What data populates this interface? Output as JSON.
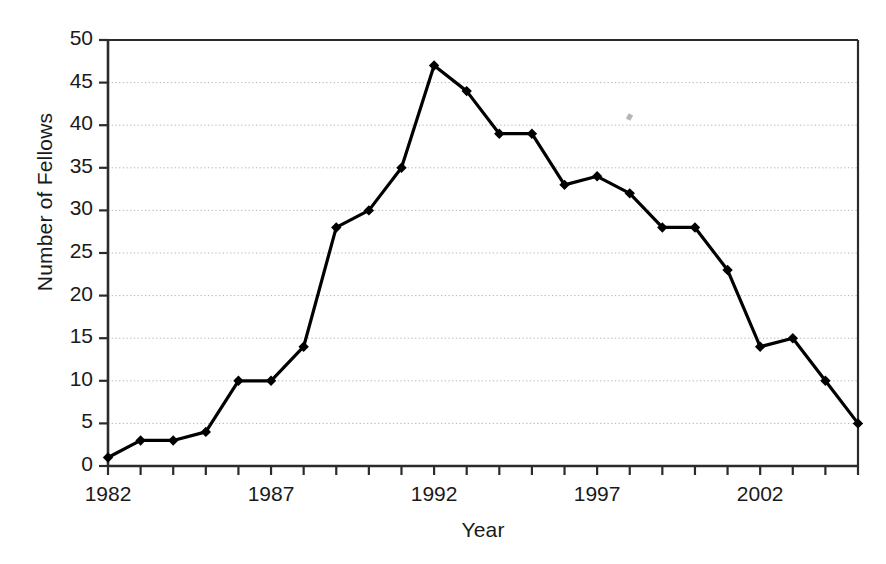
{
  "chart_data": {
    "type": "line",
    "title": "",
    "xlabel": "Year",
    "ylabel": "Number of Fellows",
    "x": [
      1982,
      1983,
      1984,
      1985,
      1986,
      1987,
      1988,
      1989,
      1990,
      1991,
      1992,
      1993,
      1994,
      1995,
      1996,
      1997,
      1998,
      1999,
      2000,
      2001,
      2002,
      2003,
      2004,
      2005
    ],
    "values": [
      1,
      3,
      3,
      4,
      10,
      10,
      14,
      28,
      30,
      35,
      47,
      44,
      39,
      39,
      33,
      34,
      32,
      28,
      28,
      23,
      14,
      15,
      10,
      5
    ],
    "series": [
      {
        "name": "Number of Fellows",
        "values": [
          1,
          3,
          3,
          4,
          10,
          10,
          14,
          28,
          30,
          35,
          47,
          44,
          39,
          39,
          33,
          34,
          32,
          28,
          28,
          23,
          14,
          15,
          10,
          5
        ]
      }
    ],
    "xlim": [
      1982,
      2005
    ],
    "ylim": [
      0,
      50
    ],
    "ytick_labels": [
      "0",
      "5",
      "10",
      "15",
      "20",
      "25",
      "30",
      "35",
      "40",
      "45",
      "50"
    ],
    "ytick_values": [
      0,
      5,
      10,
      15,
      20,
      25,
      30,
      35,
      40,
      45,
      50
    ],
    "xtick_values": [
      1982,
      1983,
      1984,
      1985,
      1986,
      1987,
      1988,
      1989,
      1990,
      1991,
      1992,
      1993,
      1994,
      1995,
      1996,
      1997,
      1998,
      1999,
      2000,
      2001,
      2002,
      2003,
      2004,
      2005
    ],
    "xtick_labeled": [
      {
        "value": 1982,
        "label": "1982"
      },
      {
        "value": 1987,
        "label": "1987"
      },
      {
        "value": 1992,
        "label": "1992"
      },
      {
        "value": 1997,
        "label": "1997"
      },
      {
        "value": 2002,
        "label": "2002"
      }
    ],
    "grid": {
      "horizontal": true,
      "vertical": false,
      "style": "dotted",
      "color": "#b4b4b4"
    },
    "legend": {
      "visible": false,
      "position": "none"
    },
    "marker": {
      "shape": "diamond",
      "color": "#000000"
    },
    "line": {
      "color": "#000000",
      "width": 3.2
    },
    "frame_color": "#2b2b2b",
    "background": "#ffffff"
  }
}
